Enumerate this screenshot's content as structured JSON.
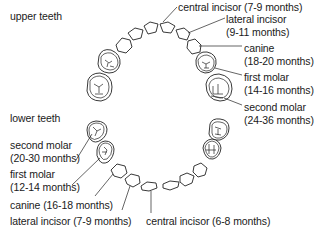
{
  "diagram": {
    "sections": {
      "upper": "upper teeth",
      "lower": "lower teeth"
    },
    "upper_teeth": [
      {
        "name": "central incisor",
        "age": "(7-9 months)",
        "label": "central incisor  (7-9 months)"
      },
      {
        "name": "lateral incisor",
        "age": "(9-11 months)"
      },
      {
        "name": "canine",
        "age": "(18-20 months)"
      },
      {
        "name": "first molar",
        "age": "(14-16 months)"
      },
      {
        "name": "second molar",
        "age": "(24-36 months)"
      }
    ],
    "lower_teeth": [
      {
        "name": "second molar",
        "age": "(20-30 months)"
      },
      {
        "name": "first molar",
        "age": "(12-14 months)"
      },
      {
        "name": "canine",
        "label": "canine (16-18 months)"
      },
      {
        "name": "lateral incisor",
        "label": "lateral incisor (7-9 months)"
      },
      {
        "name": "central incisor",
        "label": "central incisor (6-8 months)"
      }
    ]
  }
}
